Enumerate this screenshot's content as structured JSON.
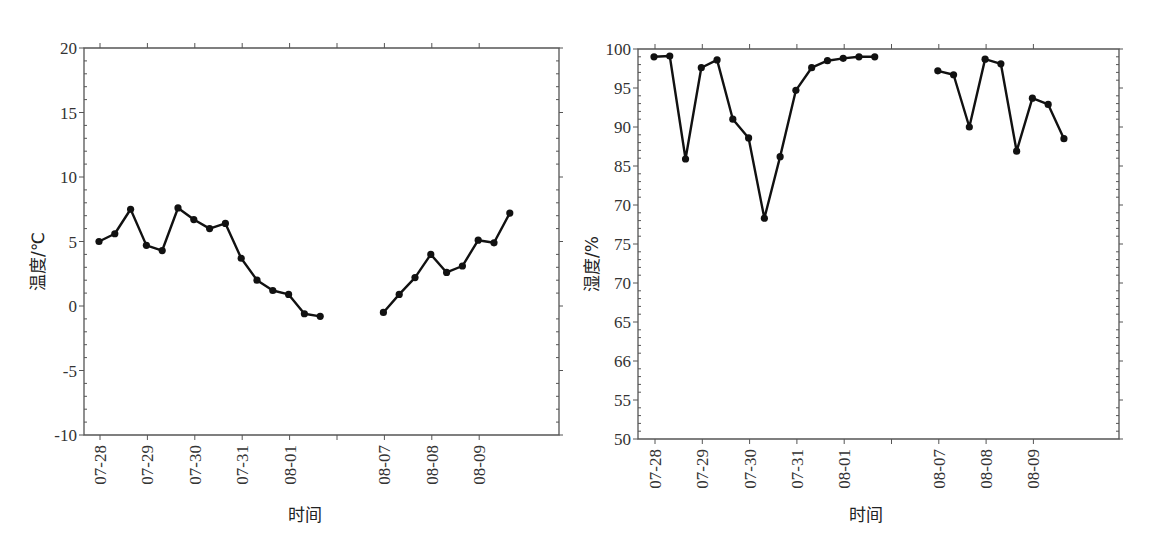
{
  "chart_data": [
    {
      "type": "line",
      "title": "",
      "xlabel": "时间",
      "ylabel": "温度/℃",
      "ylim": [
        -10,
        20
      ],
      "y_ticks": [
        "20",
        "15",
        "10",
        "5",
        "0",
        "-5",
        "-10"
      ],
      "x_ticks": [
        "07-28",
        "07-29",
        "07-30",
        "07-31",
        "08-01",
        "",
        "08-07",
        "08-08",
        "08-09"
      ],
      "grid": false,
      "legend": null,
      "points_per_day": 3,
      "series": [
        {
          "name": "segment-1",
          "start": "07-28",
          "values": [
            5.0,
            5.6,
            7.5,
            4.7,
            4.3,
            7.6,
            6.7,
            6.0,
            6.4,
            3.7,
            2.0,
            1.2,
            0.9,
            -0.6,
            -0.8
          ]
        },
        {
          "name": "segment-2",
          "start": "08-07",
          "values": [
            -0.5,
            0.9,
            2.2,
            4.0,
            2.6,
            3.1,
            5.1,
            4.9,
            7.2
          ]
        }
      ]
    },
    {
      "type": "line",
      "title": "",
      "xlabel": "时间",
      "ylabel": "湿度/%",
      "ylim": [
        50,
        100
      ],
      "y_ticks": [
        "100",
        "95",
        "90",
        "85",
        "70",
        "75",
        "70",
        "65",
        "66",
        "55",
        "50"
      ],
      "x_ticks": [
        "07-28",
        "07-29",
        "07-30",
        "07-31",
        "08-01",
        "",
        "08-07",
        "08-08",
        "08-09"
      ],
      "grid": false,
      "legend": null,
      "points_per_day": 3,
      "series": [
        {
          "name": "segment-1",
          "start": "07-28",
          "values": [
            99.0,
            99.1,
            85.9,
            97.6,
            98.6,
            91.0,
            88.6,
            78.3,
            86.2,
            94.7,
            97.6,
            98.5,
            98.8,
            99.0,
            99.0
          ]
        },
        {
          "name": "segment-2",
          "start": "08-07",
          "values": [
            97.2,
            96.7,
            90.0,
            98.7,
            98.1,
            86.9,
            93.7,
            92.9,
            88.5
          ]
        }
      ]
    }
  ],
  "left": {
    "ylabel": "温度/℃",
    "xlabel": "时间"
  },
  "right": {
    "ylabel": "湿度/%",
    "xlabel": "时间"
  }
}
